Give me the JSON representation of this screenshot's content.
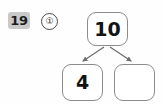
{
  "worksheet": {
    "problem_number": "19",
    "item_marker": "①",
    "badge_color": "#c9c9c9",
    "box_border_color": "#8c8c8c",
    "arrow_color": "#6f6f6f",
    "background_color": "#fefefe"
  },
  "number_bond": {
    "total": {
      "label": "10",
      "filled": true
    },
    "parts": [
      {
        "label": "4",
        "filled": true
      },
      {
        "label": "",
        "filled": false
      }
    ]
  }
}
